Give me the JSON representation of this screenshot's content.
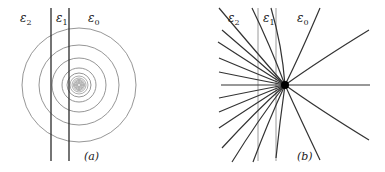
{
  "figure": {
    "panels": [
      {
        "id": "a",
        "caption": "(a)",
        "labels": [
          {
            "symbol": "ε",
            "sub": "2",
            "x": 20,
            "y": 22
          },
          {
            "symbol": "ε",
            "sub": "1",
            "x": 56,
            "y": 22
          },
          {
            "symbol": "ε",
            "sub": "0",
            "x": 90,
            "y": 22
          }
        ],
        "vertical_lines": [
          51,
          69
        ],
        "line_y": [
          8,
          161
        ],
        "center": [
          79,
          85
        ],
        "circle_radii": [
          57,
          40,
          27,
          17,
          12,
          9,
          7,
          5.5,
          4.5,
          3.5,
          2.5,
          1.5
        ],
        "circle_color": "#8a8a8a",
        "line_color": "#2a2a2a"
      },
      {
        "id": "b",
        "caption": "(b)",
        "labels": [
          {
            "symbol": "ε",
            "sub": "2",
            "x": 228,
            "y": 22
          },
          {
            "symbol": "ε",
            "sub": "1",
            "x": 262,
            "y": 22
          },
          {
            "symbol": "ε",
            "sub": "0",
            "x": 297,
            "y": 22
          }
        ],
        "vertical_lines": [
          258,
          276
        ],
        "line_y": [
          8,
          161
        ],
        "center": [
          285,
          85
        ],
        "field_line_color": "#333333",
        "vertical_line_color": "#9a9a9a"
      }
    ]
  }
}
